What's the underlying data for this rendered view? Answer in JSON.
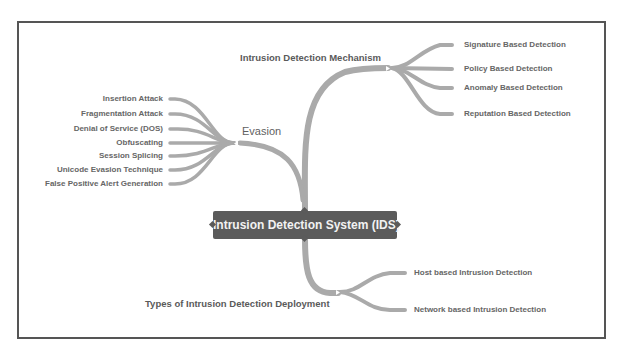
{
  "diagram": {
    "type": "mind-map",
    "root": {
      "label": "Intrusion Detection System (IDS)"
    },
    "branches": {
      "mechanism": {
        "label": "Intrusion Detection Mechanism",
        "children": [
          "Signature Based Detection",
          "Policy Based Detection",
          "Anomaly Based Detection",
          "Reputation Based Detection"
        ]
      },
      "evasion": {
        "label": "Evasion",
        "children": [
          "Insertion Attack",
          "Fragmentation Attack",
          "Denial of Service (DOS)",
          "Obfuscating",
          "Session Splicing",
          "Unicode Evasion Technique",
          "False Positive Alert Generation"
        ]
      },
      "deployment": {
        "label": "Types of Intrusion Detection Deployment",
        "children": [
          "Host based Intrusion Detection",
          "Network based Intrusion Detection"
        ]
      }
    },
    "colors": {
      "root_fill": "#5b5b5b",
      "root_text": "#f2f2f2",
      "edge": "#aaaaaa",
      "text": "#666666",
      "frame": "#555555"
    }
  }
}
